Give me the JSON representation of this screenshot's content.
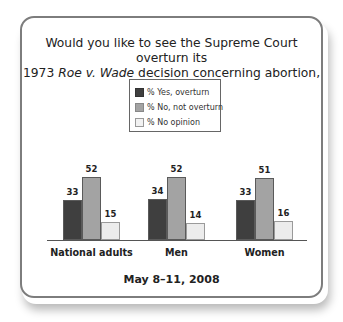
{
  "chart_data": {
    "type": "bar",
    "title_line1": "Would you like to see the Supreme Court overturn its",
    "title_line2_pre": "1973 ",
    "title_line2_italic": "Roe v. Wade",
    "title_line2_post": " decision concerning abortion, or not?",
    "categories": [
      "National adults",
      "Men",
      "Women"
    ],
    "series": [
      {
        "name": "% Yes, overturn",
        "color": "#3f3f3f",
        "values": [
          33,
          34,
          33
        ]
      },
      {
        "name": "% No, not overturn",
        "color": "#a3a3a3",
        "values": [
          52,
          52,
          51
        ]
      },
      {
        "name": "% No opinion",
        "color": "#ececec",
        "values": [
          15,
          14,
          16
        ]
      }
    ],
    "footer": "May 8–11, 2008",
    "xlabel": "",
    "ylabel": "",
    "ylim": [
      0,
      60
    ],
    "grid": false,
    "legend_position": "top-center"
  }
}
